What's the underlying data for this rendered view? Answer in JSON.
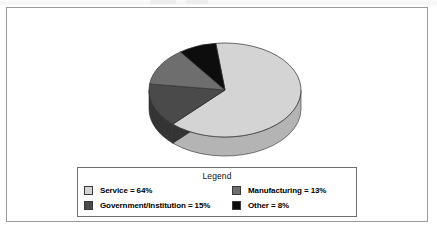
{
  "frame": {
    "border_color": "#9a9a9a",
    "background": "#ffffff"
  },
  "legend": {
    "title": "Legend",
    "entries": [
      {
        "label": "Service = 64%",
        "color": "#d4d4d4",
        "name": "service"
      },
      {
        "label": "Manufacturing = 13%",
        "color": "#6e6e6e",
        "name": "manufacturing"
      },
      {
        "label": "Government/Institution = 15%",
        "color": "#4a4a4a",
        "name": "government-institution"
      },
      {
        "label": "Other = 8%",
        "color": "#0d0d0d",
        "name": "other"
      }
    ]
  },
  "chart_data": {
    "type": "pie",
    "title": "",
    "labels": [
      "Service",
      "Government/Institution",
      "Manufacturing",
      "Other"
    ],
    "values": [
      64,
      15,
      13,
      8
    ],
    "value_suffix": "%",
    "colors": [
      "#d4d4d4",
      "#4a4a4a",
      "#6e6e6e",
      "#0d0d0d"
    ],
    "side_colors": [
      "#b4b4b4",
      "#343434",
      "#535353",
      "#000000"
    ],
    "legend_entries": [
      "Service = 64%",
      "Manufacturing = 13%",
      "Government/Institution = 15%",
      "Other = 8%"
    ],
    "legend_position": "bottom",
    "grid": false,
    "three_d": true,
    "start_angle_deg": 97,
    "direction": "clockwise",
    "geometry": {
      "cx": 82,
      "cy": 74,
      "rx": 76,
      "ry": 47,
      "depth": 19
    }
  }
}
